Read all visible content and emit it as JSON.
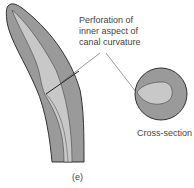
{
  "figure": {
    "panel_label": "(e)",
    "callout": {
      "lines": [
        "Perforation of",
        "inner aspect of",
        "canal curvature"
      ]
    },
    "cross_section_label": "Cross-section",
    "colors": {
      "dentin": "#9a9a9a",
      "canal": "#c8c8c8",
      "outline": "#333333",
      "leader": "#444444"
    }
  }
}
